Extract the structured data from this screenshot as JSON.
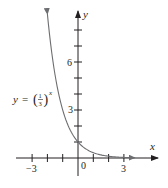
{
  "chart_data": {
    "type": "line",
    "title": "",
    "function": "y = (1/3)^x",
    "curve_label": {
      "lhs": "y",
      "eq": "=",
      "base_num": "1",
      "base_den": "3",
      "exponent": "x"
    },
    "xlabel": "x",
    "ylabel": "y",
    "xlim": [
      -3.5,
      4.5
    ],
    "ylim": [
      -1,
      9.5
    ],
    "x_ticks": [
      -3,
      -2,
      -1,
      1,
      2,
      3
    ],
    "x_tick_labels": [
      {
        "value": -3,
        "label": "−3"
      },
      {
        "value": 0,
        "label": "0"
      },
      {
        "value": 3,
        "label": "3"
      }
    ],
    "y_ticks": [
      1,
      2,
      3,
      4,
      5,
      6,
      7,
      8
    ],
    "y_tick_labels": [
      {
        "value": 3,
        "label": "3"
      },
      {
        "value": 6,
        "label": "6"
      }
    ],
    "series": [
      {
        "name": "y = (1/3)^x",
        "x": [
          -2,
          -1.5,
          -1,
          -0.5,
          0,
          0.5,
          1,
          1.5,
          2,
          2.5,
          3,
          3.7
        ],
        "values": [
          9,
          5.196,
          3,
          1.732,
          1,
          0.577,
          0.333,
          0.192,
          0.111,
          0.064,
          0.037,
          0.017
        ]
      }
    ],
    "grid": false,
    "legend": "none",
    "line_color": "#6d6e71",
    "axis_color": "#231f20"
  }
}
